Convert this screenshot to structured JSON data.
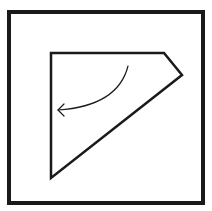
{
  "diagram": {
    "background_color": "#ffffff",
    "stroke_color": "#1a1a1a",
    "frame": {
      "x": 9,
      "y": 12,
      "width": 194,
      "height": 191,
      "stroke_width": 4
    },
    "polygon": {
      "points": [
        [
          51,
          53
        ],
        [
          164,
          53
        ],
        [
          182,
          75
        ],
        [
          51,
          178
        ]
      ],
      "stroke_width": 2.5
    },
    "arrow": {
      "path": "M 128 66 Q 118 106 58 110",
      "head": [
        [
          64,
          104
        ],
        [
          58,
          110
        ],
        [
          64,
          116
        ]
      ],
      "stroke_width": 1.2,
      "direction": "counter-clockwise"
    }
  }
}
